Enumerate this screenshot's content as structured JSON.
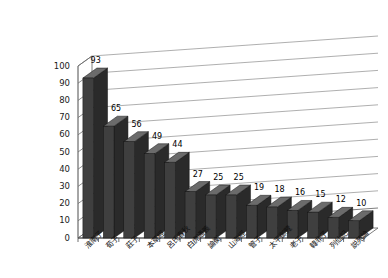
{
  "chart_data": {
    "type": "bar",
    "title": "",
    "subtitle": "",
    "xlabel": "",
    "ylabel": "",
    "ylim": [
      0,
      100
    ],
    "ytick_step": 10,
    "grid": true,
    "legend": "none",
    "style": "3d-column",
    "series_name": "",
    "yticks": [
      "0",
      "10",
      "20",
      "30",
      "40",
      "50",
      "60",
      "70",
      "80",
      "90",
      "100"
    ],
    "categories": [
      "淮南子",
      "荀子",
      "莊子",
      "本草經",
      "呂氏春秋",
      "白虎通義",
      "論衡",
      "山海經",
      "管子",
      "太平御覽",
      "老子",
      "韓非子",
      "列仙記",
      "説苑論"
    ],
    "values": [
      93,
      65,
      56,
      49,
      44,
      27,
      25,
      25,
      19,
      18,
      16,
      15,
      12,
      10
    ],
    "data_labels": [
      "93",
      "65",
      "56",
      "49",
      "44",
      "27",
      "25",
      "25",
      "19",
      "18",
      "16",
      "15",
      "12",
      "10"
    ],
    "colors": {
      "bar_front": "#3f3f3f",
      "bar_side": "#2a2a2a",
      "bar_top": "#6b6b6b",
      "grid_line": "#9a9a9a",
      "axis_line": "#4d4d4d",
      "floor": "#ffffff",
      "background": "#ffffff",
      "text": "#111111"
    }
  }
}
